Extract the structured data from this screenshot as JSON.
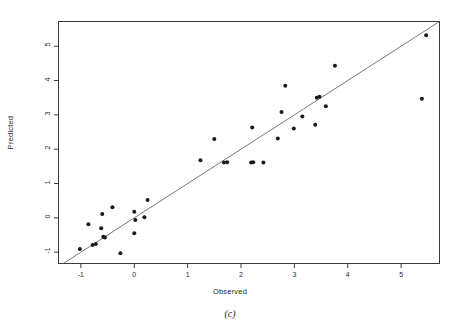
{
  "chart_data": {
    "type": "scatter",
    "title": "",
    "caption": "(c)",
    "xlabel": "Observed",
    "ylabel": "Predicted",
    "xlim": [
      -1.42,
      5.72
    ],
    "ylim": [
      -1.33,
      5.72
    ],
    "xticks": [
      -1,
      0,
      1,
      2,
      3,
      4,
      5
    ],
    "yticks": [
      -1,
      0,
      1,
      2,
      3,
      4,
      5
    ],
    "xticklabels": [
      "-1",
      "0",
      "1",
      "2",
      "3",
      "4",
      "5"
    ],
    "yticklabels": [
      "-1",
      "0",
      "1",
      "2",
      "3",
      "4",
      "5"
    ],
    "grid": false,
    "legend": null,
    "marker": "filled-circle",
    "marker_color": "#1a1a1a",
    "marker_size": 2.0,
    "reference_line": {
      "name": "identity-line",
      "type": "y=x",
      "slope": 1,
      "intercept": 0,
      "style": "solid-thin",
      "color": "#555555"
    },
    "series": [
      {
        "name": "Predicted vs Observed",
        "points": [
          [
            -1.02,
            -0.91
          ],
          [
            -0.86,
            -0.19
          ],
          [
            -0.78,
            -0.79
          ],
          [
            -0.72,
            -0.76
          ],
          [
            -0.62,
            -0.3
          ],
          [
            -0.6,
            0.11
          ],
          [
            -0.58,
            -0.55
          ],
          [
            -0.55,
            -0.57
          ],
          [
            -0.41,
            0.31
          ],
          [
            -0.26,
            -1.03
          ],
          [
            0.0,
            0.18
          ],
          [
            0.0,
            -0.45
          ],
          [
            0.02,
            -0.06
          ],
          [
            0.19,
            0.02
          ],
          [
            0.25,
            0.52
          ],
          [
            1.24,
            1.68
          ],
          [
            1.5,
            2.3
          ],
          [
            1.68,
            1.61
          ],
          [
            1.74,
            1.62
          ],
          [
            2.19,
            1.61
          ],
          [
            2.23,
            1.62
          ],
          [
            2.21,
            2.63
          ],
          [
            2.42,
            1.61
          ],
          [
            2.69,
            2.31
          ],
          [
            2.76,
            3.08
          ],
          [
            2.83,
            3.85
          ],
          [
            2.99,
            2.6
          ],
          [
            3.15,
            2.95
          ],
          [
            3.39,
            2.71
          ],
          [
            3.42,
            3.5
          ],
          [
            3.47,
            3.53
          ],
          [
            3.59,
            3.25
          ],
          [
            3.76,
            4.43
          ],
          [
            5.39,
            3.47
          ],
          [
            5.47,
            5.32
          ]
        ]
      }
    ]
  }
}
